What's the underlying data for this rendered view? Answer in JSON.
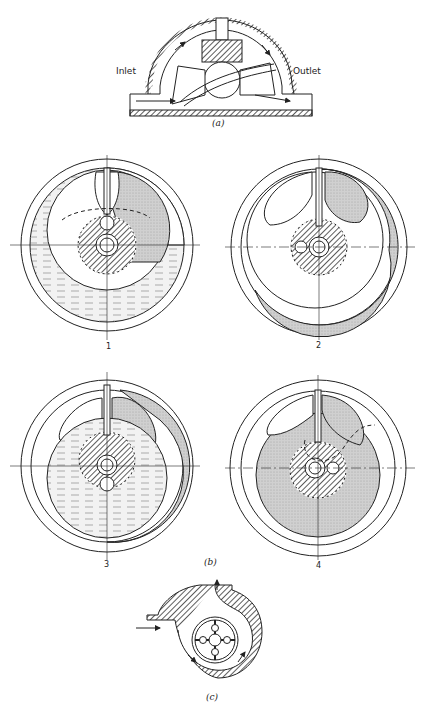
{
  "figure": {
    "panel_a": {
      "caption": "(a)",
      "labels": {
        "inlet": "Inlet",
        "outlet": "Outlet"
      }
    },
    "panel_b": {
      "caption": "(b)",
      "stages": [
        "1",
        "2",
        "3",
        "4"
      ]
    },
    "panel_c": {
      "caption": "(c)"
    },
    "colors": {
      "line": "#222222",
      "shade": "#c8c8c8",
      "liquid": "#e2e2e2",
      "hatch": "#555555"
    }
  }
}
